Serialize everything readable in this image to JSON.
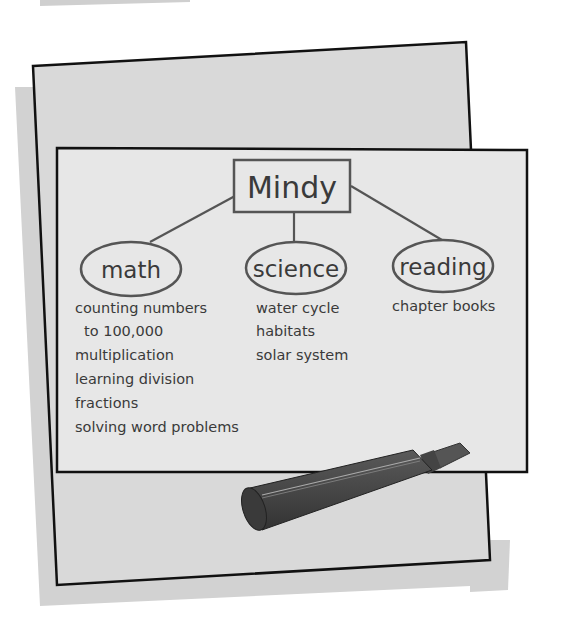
{
  "diagram": {
    "type": "concept-web",
    "root": {
      "label": "Mindy"
    },
    "branches": [
      {
        "label": "math",
        "items": [
          "counting numbers",
          "to 100,000",
          "multiplication",
          "learning division",
          "fractions",
          "solving word problems"
        ]
      },
      {
        "label": "science",
        "items": [
          "water cycle",
          "habitats",
          "solar system"
        ]
      },
      {
        "label": "reading",
        "items": [
          "chapter books"
        ]
      }
    ]
  },
  "scene": {
    "board_color": "#d9d9d9",
    "sheet_color": "#e6e6e6",
    "shadow_color": "#cccccc",
    "outline_color": "#111111",
    "ink_color": "#3a3a3a",
    "marker_color": "#4a4a4a",
    "objects": [
      "chart-paper-board",
      "marker"
    ]
  }
}
